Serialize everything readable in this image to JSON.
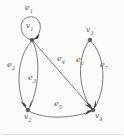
{
  "figure": {
    "type": "directed-multigraph",
    "background_color": "#fbfbfa",
    "edge_color": "#6d6d6d",
    "vertex_color": "#585858",
    "label_color": "#5b5b5b"
  },
  "vertices": [
    {
      "id": "v1",
      "label": "v",
      "sub": "1",
      "x": 32,
      "y": 40,
      "label_position": "inside-loop"
    },
    {
      "id": "v2",
      "label": "v",
      "sub": "2",
      "x": 28,
      "y": 110,
      "label_position": "below"
    },
    {
      "id": "v3",
      "label": "v",
      "sub": "3",
      "x": 90,
      "y": 40,
      "label_position": "above"
    },
    {
      "id": "v4",
      "label": "v",
      "sub": "4",
      "x": 93,
      "y": 110,
      "label_position": "below-right"
    }
  ],
  "edges": [
    {
      "id": "e1",
      "label": "e",
      "sub": "1",
      "from": "v1",
      "to": "v1",
      "kind": "self-loop",
      "label_x": 25,
      "label_y": 6
    },
    {
      "id": "e2",
      "label": "e",
      "sub": "2",
      "from": "v1",
      "to": "v2",
      "kind": "curve-left",
      "label_x": 8,
      "label_y": 64
    },
    {
      "id": "e3",
      "label": "e",
      "sub": "3",
      "from": "v1",
      "to": "v2",
      "kind": "curve-right",
      "label_x": 29,
      "label_y": 76
    },
    {
      "id": "e4",
      "label": "e",
      "sub": "4",
      "from": "v1",
      "to": "v4",
      "kind": "straight",
      "label_x": 58,
      "label_y": 58
    },
    {
      "id": "e5",
      "label": "e",
      "sub": "5",
      "from": "v2",
      "to": "v4",
      "kind": "curve-bottom",
      "label_x": 55,
      "label_y": 102
    },
    {
      "id": "e6",
      "label": "e",
      "sub": "6",
      "from": "v3",
      "to": "v4",
      "kind": "curve-left",
      "label_x": 77,
      "label_y": 58
    },
    {
      "id": "e7",
      "label": "e",
      "sub": "7",
      "from": "v3",
      "to": "v4",
      "kind": "curve-right",
      "label_x": 101,
      "label_y": 62
    }
  ]
}
